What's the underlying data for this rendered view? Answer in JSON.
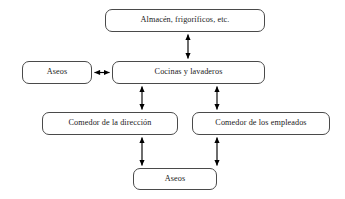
{
  "diagram": {
    "language": "es",
    "style": {
      "background_color": "#ffffff",
      "node_fill": "#ffffff",
      "node_border_color": "#4a4a4a",
      "text_color": "#1a1a1a",
      "edge_color": "#000000"
    },
    "nodes": [
      {
        "id": "almacen",
        "label": "Almacén, frigoríficos, etc."
      },
      {
        "id": "aseos_sup",
        "label": "Aseos"
      },
      {
        "id": "cocinas",
        "label": "Cocinas y lavaderos"
      },
      {
        "id": "com_dir",
        "label": "Comedor de la dirección"
      },
      {
        "id": "com_emp",
        "label": "Comedor de los empleados"
      },
      {
        "id": "aseos_inf",
        "label": "Aseos"
      }
    ],
    "edges": [
      {
        "id": "edge-almacen-cocinas",
        "from": "almacen",
        "to": "cocinas",
        "direction": "bidirectional",
        "orientation": "vertical"
      },
      {
        "id": "edge-aseos-cocinas",
        "from": "aseos_sup",
        "to": "cocinas",
        "direction": "bidirectional",
        "orientation": "horizontal"
      },
      {
        "id": "edge-cocinas-comdir",
        "from": "cocinas",
        "to": "com_dir",
        "direction": "bidirectional",
        "orientation": "vertical"
      },
      {
        "id": "edge-cocinas-comemp",
        "from": "cocinas",
        "to": "com_emp",
        "direction": "bidirectional",
        "orientation": "vertical"
      },
      {
        "id": "edge-comdir-aseos",
        "from": "com_dir",
        "to": "aseos_inf",
        "direction": "bidirectional",
        "orientation": "vertical"
      },
      {
        "id": "edge-comemp-aseos",
        "from": "com_emp",
        "to": "aseos_inf",
        "direction": "bidirectional",
        "orientation": "vertical"
      }
    ]
  }
}
